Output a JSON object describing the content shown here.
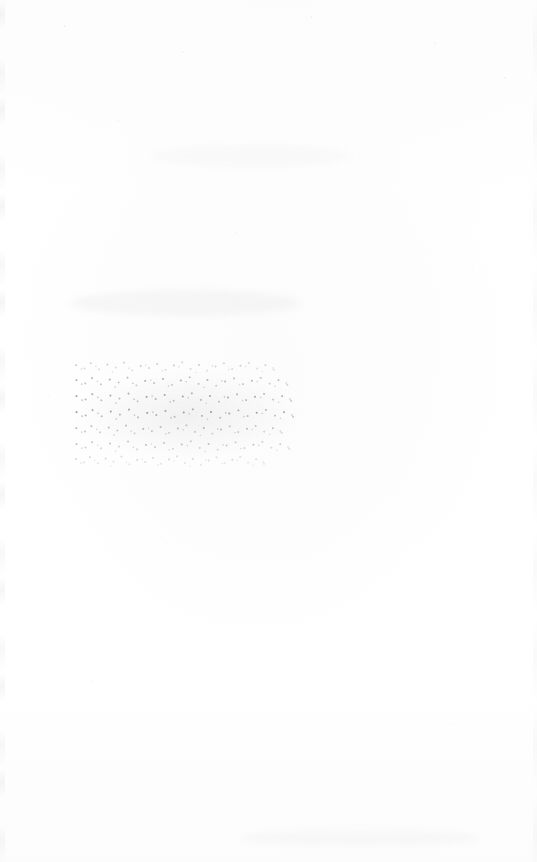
{
  "page": {
    "kind": "scanned-document-page",
    "width_px": 537,
    "height_px": 862,
    "background_color": "#ffffff",
    "paper_tone_color": "#fdfdfd",
    "condition": "blank page with a single heavily faded, illegible text block; remainder is empty aside from scanner speckle and faint edge artifacts",
    "visible_text_count": 0
  },
  "content_block": {
    "name": "faded-text-block",
    "left_px": 72,
    "top_px": 358,
    "width_px": 228,
    "height_px": 114,
    "line_count": 7,
    "ink_color": "#5a5a62",
    "legibility": "illegible",
    "legibility_note": "No characters are resolvable at maximum inspection magnification; the block reads as degraded speckled line bands only.",
    "lines": [
      {
        "index": 1,
        "width_px": 208,
        "density": 0.52
      },
      {
        "index": 2,
        "width_px": 222,
        "density": 0.8
      },
      {
        "index": 3,
        "width_px": 226,
        "density": 0.95
      },
      {
        "index": 4,
        "width_px": 228,
        "density": 1.0
      },
      {
        "index": 5,
        "width_px": 216,
        "density": 0.72
      },
      {
        "index": 6,
        "width_px": 224,
        "density": 0.62
      },
      {
        "index": 7,
        "width_px": 198,
        "density": 0.4
      }
    ]
  },
  "artifacts": {
    "scan_edge_left": true,
    "scan_edge_right": true,
    "speckle_field": true,
    "smudges": [
      {
        "name": "smudge-upper",
        "left_px": 150,
        "top_px": 145,
        "width_px": 200,
        "height_px": 22
      },
      {
        "name": "smudge-middle",
        "left_px": 70,
        "top_px": 290,
        "width_px": 230,
        "height_px": 26
      },
      {
        "name": "smudge-bottom",
        "left_px": 240,
        "top_px": 830,
        "width_px": 240,
        "height_px": 16
      }
    ]
  }
}
